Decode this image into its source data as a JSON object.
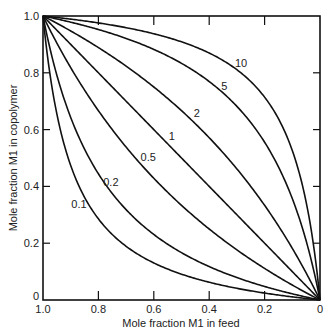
{
  "chart_data": {
    "type": "line",
    "title": "",
    "xlabel": "Mole fraction M1 in feed",
    "ylabel": "Mole fraction M1 in copolymer",
    "xlim": [
      1.0,
      0
    ],
    "ylim": [
      0,
      1.0
    ],
    "x_reversed": true,
    "grid": false,
    "legend": "inline curve labels",
    "x_ticks": [
      "1.0",
      "0.8",
      "0.6",
      "0.4",
      "0.2",
      "0"
    ],
    "y_ticks": [
      "0",
      "0.2",
      "0.4",
      "0.6",
      "0.8",
      "1.0"
    ],
    "series": [
      {
        "name": "10",
        "r1": 10,
        "label_pos": [
          0.285,
          0.82
        ]
      },
      {
        "name": "5",
        "r1": 5,
        "label_pos": [
          0.345,
          0.74
        ]
      },
      {
        "name": "2",
        "r1": 2,
        "label_pos": [
          0.445,
          0.645
        ]
      },
      {
        "name": "1",
        "r1": 1,
        "label_pos": [
          0.535,
          0.565
        ]
      },
      {
        "name": "0.5",
        "r1": 0.5,
        "label_pos": [
          0.62,
          0.49
        ]
      },
      {
        "name": "0.2",
        "r1": 0.2,
        "label_pos": [
          0.755,
          0.4
        ]
      },
      {
        "name": "0.1",
        "r1": 0.1,
        "label_pos": [
          0.87,
          0.325
        ]
      }
    ],
    "sample_points": {
      "x": [
        1.0,
        0.8,
        0.6,
        0.4,
        0.2,
        0
      ],
      "10": [
        1.0,
        0.976,
        0.938,
        0.87,
        0.714,
        0
      ],
      "5": [
        1.0,
        0.952,
        0.882,
        0.769,
        0.556,
        0
      ],
      "2": [
        1.0,
        0.889,
        0.75,
        0.571,
        0.333,
        0
      ],
      "1": [
        1.0,
        0.8,
        0.6,
        0.4,
        0.2,
        0
      ],
      "0.5": [
        1.0,
        0.667,
        0.429,
        0.25,
        0.111,
        0
      ],
      "0.2": [
        1.0,
        0.444,
        0.231,
        0.118,
        0.048,
        0
      ],
      "0.1": [
        1.0,
        0.286,
        0.13,
        0.063,
        0.024,
        0
      ]
    }
  }
}
